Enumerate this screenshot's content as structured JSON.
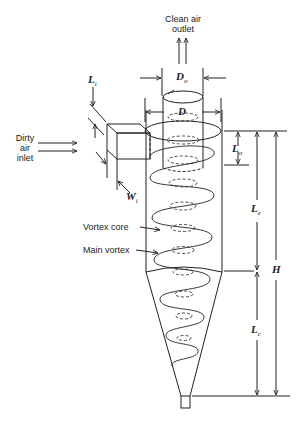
{
  "diagram": {
    "labels": {
      "clean_air_outlet_line1": "Clean air",
      "clean_air_outlet_line2": "outlet",
      "dirty_air_inlet_line1": "Dirty",
      "dirty_air_inlet_line2": "air",
      "dirty_air_inlet_line3": "inlet",
      "vortex_core": "Vortex core",
      "main_vortex": "Main vortex"
    },
    "dimensions": {
      "Do": {
        "sym": "D",
        "sub": "o"
      },
      "D": {
        "sym": "D",
        "sub": ""
      },
      "Li": {
        "sym": "L",
        "sub": "i"
      },
      "Wi": {
        "sym": "W",
        "sub": "i"
      },
      "Lo": {
        "sym": "L",
        "sub": "o"
      },
      "Le": {
        "sym": "L",
        "sub": "e"
      },
      "Lc": {
        "sym": "L",
        "sub": "c"
      },
      "H": {
        "sym": "H",
        "sub": ""
      }
    },
    "colors": {
      "ink": "#222222",
      "background": "#ffffff"
    }
  }
}
